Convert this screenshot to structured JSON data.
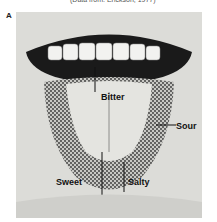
{
  "caption": "(Data from: Erickson, 1977)",
  "panel_letter": "A",
  "labels": {
    "bitter": "Bitter",
    "sour": "Sour",
    "sweet": "Sweet",
    "salty": "Salty"
  }
}
